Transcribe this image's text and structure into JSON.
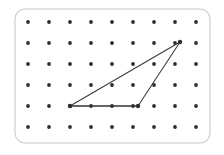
{
  "figure": {
    "canvas": {
      "width": 224,
      "height": 155,
      "background": "#ffffff"
    },
    "board": {
      "name": "geoboard-frame",
      "x": 15,
      "y": 9,
      "width": 195,
      "height": 134,
      "corner_radius": 10,
      "stroke_color": "#c9c9c9",
      "fill_color": "#ffffff",
      "stroke_width": 1.1
    },
    "grid": {
      "columns": 9,
      "rows": 6,
      "spacing_x": 21,
      "spacing_y": 21,
      "origin_x": 28,
      "origin_y": 22,
      "peg_radius": 1.9,
      "peg_color": "#2e2e2e",
      "column_x": [
        28,
        49,
        70,
        91,
        112,
        133,
        154,
        175,
        196
      ],
      "row_y": [
        22,
        43,
        64,
        85,
        106,
        127
      ]
    },
    "shape": {
      "name": "triangle",
      "kind": "polygon",
      "stroke_color": "#3a3a3a",
      "stroke_width": 1.05,
      "vertices": [
        {
          "label": "A",
          "grid_col": 2,
          "grid_row": 4,
          "x": 70,
          "y": 106
        },
        {
          "label": "B",
          "grid_col": 5,
          "grid_row": 4,
          "x": 138,
          "y": 106
        },
        {
          "label": "C",
          "grid_col": 7,
          "grid_row": 1,
          "x": 180,
          "y": 42
        }
      ],
      "segments": [
        {
          "name": "base",
          "from": "A",
          "to": "B",
          "emphasis": "heavy",
          "stroke_color": "#323232",
          "stroke_width": 1.5
        },
        {
          "name": "right-side",
          "from": "B",
          "to": "C",
          "emphasis": "normal",
          "stroke_color": "#3a3a3a",
          "stroke_width": 1.05
        },
        {
          "name": "hypotenuse",
          "from": "C",
          "to": "A",
          "emphasis": "normal",
          "stroke_color": "#3a3a3a",
          "stroke_width": 1.05
        }
      ]
    }
  }
}
